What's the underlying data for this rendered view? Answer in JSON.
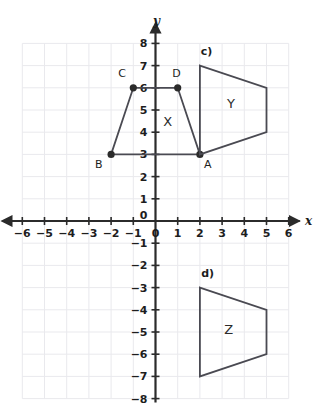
{
  "chart_data": {
    "type": "scatter",
    "title": "",
    "xlabel": "x",
    "ylabel": "y",
    "xlim": [
      -6,
      6
    ],
    "ylim": [
      -8,
      8
    ],
    "grid": true,
    "legend_position": "none",
    "x_ticks": [
      -6,
      -5,
      -4,
      -3,
      -2,
      -1,
      0,
      1,
      2,
      3,
      4,
      5,
      6
    ],
    "y_ticks": [
      8,
      7,
      6,
      5,
      4,
      3,
      2,
      1,
      0,
      -1,
      -2,
      -3,
      -4,
      -5,
      -6,
      -7,
      -8
    ],
    "x_tick_labels": [
      "−6",
      "−5",
      "−4",
      "−3",
      "−2",
      "−1",
      "0",
      "1",
      "2",
      "3",
      "4",
      "5",
      "6"
    ],
    "y_tick_labels": [
      "8",
      "7",
      "6",
      "5",
      "4",
      "3",
      "2",
      "1",
      "0",
      "−1",
      "−2",
      "−3",
      "−4",
      "−5",
      "−6",
      "−7",
      "−8"
    ],
    "origin_label": "0",
    "shapes": [
      {
        "name": "X",
        "label": "X",
        "label_pos": [
          0.55,
          4.5
        ],
        "part_label": "",
        "vertices": [
          [
            2,
            3
          ],
          [
            -2,
            3
          ],
          [
            -1,
            6
          ],
          [
            1,
            6
          ]
        ],
        "vertex_labels": [
          {
            "name": "A",
            "point": [
              2,
              3
            ],
            "label_pos": [
              2.35,
              2.55
            ]
          },
          {
            "name": "B",
            "point": [
              -2,
              3
            ],
            "label_pos": [
              -2.55,
              2.55
            ]
          },
          {
            "name": "C",
            "point": [
              -1,
              6
            ],
            "label_pos": [
              -1.5,
              6.65
            ]
          },
          {
            "name": "D",
            "point": [
              1,
              6
            ],
            "label_pos": [
              0.95,
              6.65
            ]
          }
        ]
      },
      {
        "name": "Y",
        "label": "Y",
        "label_pos": [
          3.4,
          5.3
        ],
        "part_label": "c)",
        "part_label_pos": [
          2.3,
          7.65
        ],
        "vertices": [
          [
            2,
            7
          ],
          [
            5,
            6
          ],
          [
            5,
            4
          ],
          [
            2,
            3
          ]
        ],
        "vertex_labels": []
      },
      {
        "name": "Z",
        "label": "Z",
        "label_pos": [
          3.3,
          -4.85
        ],
        "part_label": "d)",
        "part_label_pos": [
          2.35,
          -2.35
        ],
        "vertices": [
          [
            2,
            -3
          ],
          [
            5,
            -4
          ],
          [
            5,
            -6
          ],
          [
            2,
            -7
          ]
        ],
        "vertex_labels": []
      }
    ]
  },
  "axes": {
    "x_axis_name": "x",
    "y_axis_name": "y"
  }
}
